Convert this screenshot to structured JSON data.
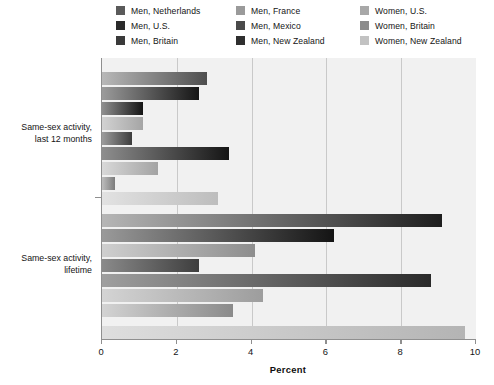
{
  "legend": {
    "items": [
      {
        "label": "Men, Netherlands",
        "color": "#5a5a5a",
        "col": 0,
        "row": 0
      },
      {
        "label": "Men, U.S.",
        "color": "#2b2b2b",
        "col": 0,
        "row": 1
      },
      {
        "label": "Men, Britain",
        "color": "#3a3a3a",
        "col": 0,
        "row": 2
      },
      {
        "label": "Men, France",
        "color": "#9a9a9a",
        "col": 1,
        "row": 0
      },
      {
        "label": "Men, Mexico",
        "color": "#4a4a4a",
        "col": 1,
        "row": 1
      },
      {
        "label": "Men, New Zealand",
        "color": "#2f2f2f",
        "col": 1,
        "row": 2
      },
      {
        "label": "Women, U.S.",
        "color": "#a8a8a8",
        "col": 2,
        "row": 0
      },
      {
        "label": "Women, Britain",
        "color": "#8c8c8c",
        "col": 2,
        "row": 1
      },
      {
        "label": "Women, New Zealand",
        "color": "#c2c2c2",
        "col": 2,
        "row": 2
      }
    ]
  },
  "axis": {
    "x_title": "Percent",
    "x_ticks": [
      "0",
      "2",
      "4",
      "6",
      "8",
      "10"
    ],
    "x_min": 0,
    "x_max": 10
  },
  "categories": [
    {
      "line1": "Same-sex activity,",
      "line2": "last 12 months"
    },
    {
      "line1": "Same-sex activity,",
      "line2": "lifetime"
    }
  ],
  "chart_data": {
    "type": "bar",
    "orientation": "horizontal",
    "title": "",
    "xlabel": "Percent",
    "ylabel": "",
    "xlim": [
      0,
      10
    ],
    "grid": true,
    "legend_position": "top",
    "categories": [
      "Same-sex activity, last 12 months",
      "Same-sex activity, lifetime"
    ],
    "series": [
      {
        "name": "Men, Netherlands",
        "color": "#5a5a5a",
        "values": [
          2.8,
          9.1
        ]
      },
      {
        "name": "Men, U.S.",
        "color": "#2b2b2b",
        "values": [
          2.6,
          6.2
        ]
      },
      {
        "name": "Men, Britain",
        "color": "#3a3a3a",
        "values": [
          1.1,
          4.1
        ]
      },
      {
        "name": "Men, France",
        "color": "#9a9a9a",
        "values": [
          1.1,
          4.1
        ]
      },
      {
        "name": "Men, Mexico",
        "color": "#4a4a4a",
        "values": [
          0.8,
          8.8
        ]
      },
      {
        "name": "Men, New Zealand",
        "color": "#2f2f2f",
        "values": [
          3.4,
          null
        ]
      },
      {
        "name": "Women, U.S.",
        "color": "#a8a8a8",
        "values": [
          1.5,
          4.3
        ]
      },
      {
        "name": "Women, Britain",
        "color": "#8c8c8c",
        "values": [
          0.35,
          3.5
        ]
      },
      {
        "name": "Women, New Zealand",
        "color": "#c2c2c2",
        "values": [
          3.1,
          9.7
        ]
      }
    ]
  },
  "bars": {
    "group1": [
      {
        "name": "Men, Netherlands",
        "value": 2.8,
        "top": 14,
        "light": "#b8b8b8",
        "dark": "#4e4e4e"
      },
      {
        "name": "Men, U.S.",
        "value": 2.6,
        "top": 29,
        "light": "#9b9b9b",
        "dark": "#151515"
      },
      {
        "name": "Men, Britain",
        "value": 1.1,
        "top": 44,
        "light": "#8f8f8f",
        "dark": "#141414"
      },
      {
        "name": "Men, France",
        "value": 1.1,
        "top": 59,
        "light": "#d2d2d2",
        "dark": "#a5a5a5"
      },
      {
        "name": "Men, Mexico",
        "value": 0.8,
        "top": 74,
        "light": "#9d9d9d",
        "dark": "#3c3c3c"
      },
      {
        "name": "Men, New Zealand",
        "value": 3.4,
        "top": 89,
        "light": "#8e8e8e",
        "dark": "#151515"
      },
      {
        "name": "Women, U.S.",
        "value": 1.5,
        "top": 104,
        "light": "#d8d8d8",
        "dark": "#a3a3a3"
      },
      {
        "name": "Women, Britain",
        "value": 0.35,
        "top": 119,
        "light": "#bdbdbd",
        "dark": "#7c7c7c"
      },
      {
        "name": "Women, New Zealand",
        "value": 3.1,
        "top": 134,
        "light": "#e2e2e2",
        "dark": "#bdbdbd"
      }
    ],
    "group2": [
      {
        "name": "Men, Netherlands",
        "value": 9.1,
        "top": 156,
        "light": "#b6b6b6",
        "dark": "#1e1e1e"
      },
      {
        "name": "Men, U.S.",
        "value": 6.2,
        "top": 171,
        "light": "#9a9a9a",
        "dark": "#141414"
      },
      {
        "name": "Men, Britain",
        "value": 4.1,
        "top": 186,
        "light": "#cfcfcf",
        "dark": "#8d8d8d"
      },
      {
        "name": "Men, Mexico",
        "value": 2.6,
        "top": 201,
        "light": "#8a8a8a",
        "dark": "#3e3e3e"
      },
      {
        "name": "Men, New Zealand",
        "value": 8.8,
        "top": 216,
        "light": "#9f9f9f",
        "dark": "#2a2a2a"
      },
      {
        "name": "Women, U.S.",
        "value": 4.3,
        "top": 231,
        "light": "#d4d4d4",
        "dark": "#9d9d9d"
      },
      {
        "name": "Women, Britain",
        "value": 3.5,
        "top": 246,
        "light": "#d3d3d3",
        "dark": "#8a8a8a"
      },
      {
        "name": "Women, New Zealand",
        "value": 9.7,
        "top": 268,
        "light": "#dedede",
        "dark": "#b4b4b4"
      }
    ]
  }
}
